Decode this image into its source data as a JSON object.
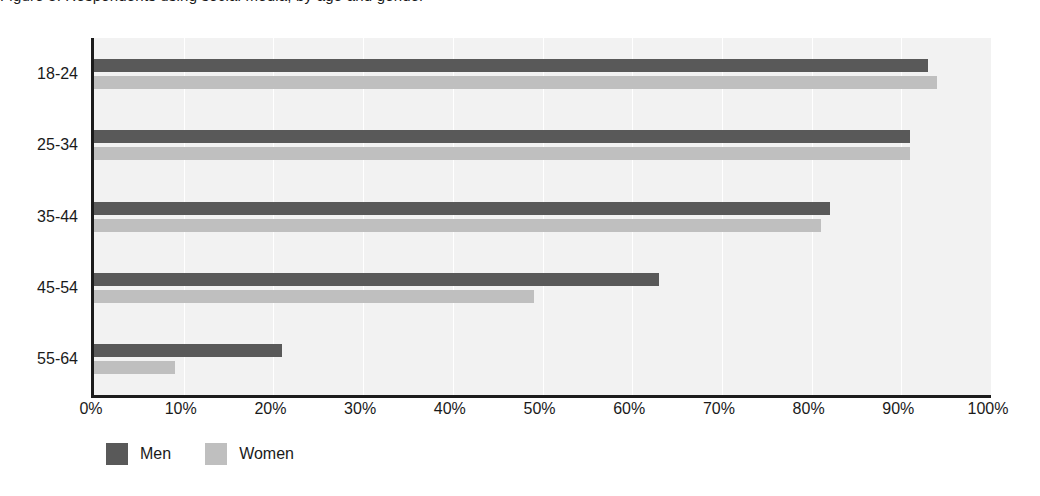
{
  "title_clipped": "Figure 3. Respondents using social media, by age and gender",
  "chart_data": {
    "type": "bar",
    "orientation": "horizontal",
    "title": "",
    "xlabel": "",
    "ylabel": "",
    "categories": [
      "18-24",
      "25-34",
      "35-44",
      "45-54",
      "55-64"
    ],
    "series": [
      {
        "name": "Men",
        "color": "#595959",
        "values": [
          93,
          91,
          82,
          63,
          21
        ]
      },
      {
        "name": "Women",
        "color": "#bfbfbf",
        "values": [
          94,
          91,
          81,
          49,
          9
        ]
      }
    ],
    "xlim": [
      0,
      100
    ],
    "xticks": [
      0,
      10,
      20,
      30,
      40,
      50,
      60,
      70,
      80,
      90,
      100
    ],
    "xticklabels": [
      "0%",
      "10%",
      "20%",
      "30%",
      "40%",
      "50%",
      "60%",
      "70%",
      "80%",
      "90%",
      "100%"
    ],
    "value_suffix": "%",
    "grid": "vertical",
    "gridline_color": "#ffffff",
    "plot_background": "#f2f2f2",
    "axis_color": "#1c1c1c",
    "legend_position": "bottom-left"
  },
  "legend": {
    "items": [
      {
        "label": "Men",
        "color": "#595959"
      },
      {
        "label": "Women",
        "color": "#bfbfbf"
      }
    ]
  }
}
